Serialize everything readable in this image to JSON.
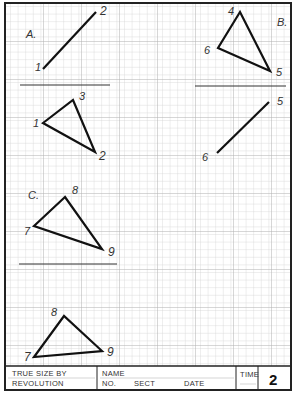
{
  "sheet": {
    "colors": {
      "grid_minor": "#d2d2d2",
      "grid_major": "#b4b4b4",
      "ink": "#111111",
      "border": "#222222"
    },
    "problems": [
      {
        "id": "A",
        "label": "A.",
        "line_points": [
          "1",
          "2"
        ],
        "triangle_points": [
          "1",
          "2",
          "3"
        ]
      },
      {
        "id": "B",
        "label": "B.",
        "triangle_points": [
          "4",
          "5",
          "6"
        ],
        "line_points": [
          "5",
          "6"
        ]
      },
      {
        "id": "C",
        "label": "C.",
        "triangle_points": [
          "7",
          "8",
          "9"
        ],
        "result_triangle_points": [
          "7",
          "8",
          "9"
        ]
      }
    ]
  },
  "labels": {
    "A": "A.",
    "B": "B.",
    "C": "C.",
    "p1a": "1",
    "p2a": "2",
    "p3": "3",
    "p1b": "1",
    "p2b": "2",
    "p4": "4",
    "p6a": "6",
    "p5a": "5",
    "p5b": "5",
    "p6b": "6",
    "p8a": "8",
    "p7a": "7",
    "p9a": "9",
    "p8b": "8",
    "p7b": "7",
    "p9b": "9"
  },
  "title_block": {
    "title_line1": "TRUE SIZE BY",
    "title_line2": "REVOLUTION",
    "name_label": "NAME",
    "no_label": "NO.",
    "sect_label": "SECT",
    "date_label": "DATE",
    "time_label": "TIME",
    "sheet_number": "2"
  }
}
